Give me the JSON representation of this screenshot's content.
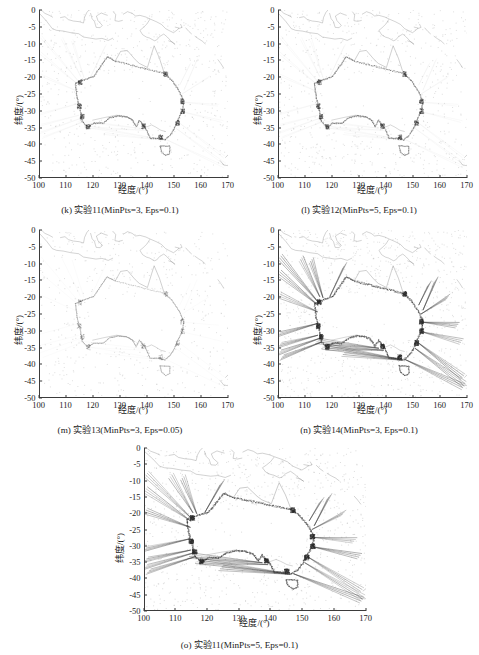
{
  "figure": {
    "kind": "multi-panel-scatter-map",
    "panel_count": 5,
    "layout": "2-2-1",
    "colors": {
      "coastline": "#6e6e6e",
      "cluster_dark": "#2b2b2b",
      "noise_light": "#b9b9b9",
      "axis": "#3b3b3b",
      "background": "#ffffff"
    }
  },
  "axes": {
    "xlabel": "经度/(°)",
    "ylabel": "纬度/(°)",
    "xticks": [
      "100",
      "110",
      "120",
      "130",
      "140",
      "150",
      "160",
      "170"
    ],
    "yticks": [
      "0",
      "-5",
      "-10",
      "-15",
      "-20",
      "-25",
      "-30",
      "-35",
      "-40",
      "-45",
      "-50"
    ],
    "xlim": [
      100,
      170
    ],
    "ylim": [
      -50,
      0
    ]
  },
  "panels": [
    {
      "id": "k",
      "caption": "(k) 实验11(MinPts=3, Eps=0.1)",
      "experiment": "实验11",
      "minpts": "3",
      "eps": "0.1",
      "density": "medium",
      "ray_strength": 0.25
    },
    {
      "id": "l",
      "caption": "(l) 实验12(MinPts=5, Eps=0.1)",
      "experiment": "实验12",
      "minpts": "5",
      "eps": "0.1",
      "density": "medium",
      "ray_strength": 0.3
    },
    {
      "id": "m",
      "caption": "(m) 实验13(MinPts=3, Eps=0.05)",
      "experiment": "实验13",
      "minpts": "3",
      "eps": "0.05",
      "density": "sparse",
      "ray_strength": 0.12
    },
    {
      "id": "n",
      "caption": "(n) 实验14(MinPts=3, Eps=0.1)",
      "experiment": "实验14",
      "minpts": "3",
      "eps": "0.1",
      "density": "dense",
      "ray_strength": 1.0
    },
    {
      "id": "o",
      "caption": "(o) 实验11(MinPts=5, Eps=0.1)",
      "experiment": "实验11",
      "minpts": "5",
      "eps": "0.1",
      "density": "dense",
      "ray_strength": 0.85
    }
  ],
  "chart_data": {
    "type": "scatter",
    "title": "",
    "xlabel": "经度/(°)",
    "ylabel": "纬度/(°)",
    "xlim": [
      100,
      170
    ],
    "ylim": [
      -50,
      0
    ],
    "xticks": [
      100,
      110,
      120,
      130,
      140,
      150,
      160,
      170
    ],
    "yticks": [
      0,
      -5,
      -10,
      -15,
      -20,
      -25,
      -30,
      -35,
      -40,
      -45,
      -50
    ],
    "grid": false,
    "legend": null,
    "subplots": [
      {
        "id": "k",
        "label": "(k) 实验11(MinPts=3, Eps=0.1)",
        "params": {
          "MinPts": 3,
          "Eps": 0.1
        }
      },
      {
        "id": "l",
        "label": "(l) 实验12(MinPts=5, Eps=0.1)",
        "params": {
          "MinPts": 5,
          "Eps": 0.1
        }
      },
      {
        "id": "m",
        "label": "(m) 实验13(MinPts=3, Eps=0.05)",
        "params": {
          "MinPts": 3,
          "Eps": 0.05
        }
      },
      {
        "id": "n",
        "label": "(n) 实验14(MinPts=3, Eps=0.1)",
        "params": {
          "MinPts": 3,
          "Eps": 0.1
        }
      },
      {
        "id": "o",
        "label": "(o) 实验11(MinPts=5, Eps=0.1)",
        "params": {
          "MinPts": 5,
          "Eps": 0.1
        }
      }
    ],
    "coastline_outline": {
      "name": "Australia and surrounding region coastline",
      "australia_mainland": [
        [
          113.2,
          -22.0
        ],
        [
          113.8,
          -26.1
        ],
        [
          115.0,
          -30.0
        ],
        [
          115.7,
          -33.3
        ],
        [
          117.8,
          -35.1
        ],
        [
          120.0,
          -33.9
        ],
        [
          123.5,
          -33.9
        ],
        [
          126.0,
          -32.3
        ],
        [
          129.0,
          -31.7
        ],
        [
          132.2,
          -32.0
        ],
        [
          134.2,
          -32.8
        ],
        [
          135.8,
          -34.9
        ],
        [
          137.0,
          -33.0
        ],
        [
          138.1,
          -34.2
        ],
        [
          139.5,
          -35.6
        ],
        [
          141.0,
          -38.4
        ],
        [
          144.5,
          -38.4
        ],
        [
          146.4,
          -38.9
        ],
        [
          148.5,
          -37.5
        ],
        [
          150.0,
          -35.5
        ],
        [
          151.3,
          -33.0
        ],
        [
          153.0,
          -30.3
        ],
        [
          153.5,
          -27.4
        ],
        [
          152.0,
          -24.5
        ],
        [
          149.2,
          -21.1
        ],
        [
          146.3,
          -19.0
        ],
        [
          144.5,
          -14.5
        ],
        [
          142.5,
          -10.7
        ],
        [
          141.6,
          -13.0
        ],
        [
          140.0,
          -17.2
        ],
        [
          137.0,
          -16.0
        ],
        [
          135.5,
          -14.9
        ],
        [
          132.5,
          -12.1
        ],
        [
          130.0,
          -12.4
        ],
        [
          128.0,
          -15.3
        ],
        [
          125.0,
          -14.0
        ],
        [
          122.2,
          -17.3
        ],
        [
          120.0,
          -19.9
        ],
        [
          117.0,
          -20.7
        ],
        [
          113.2,
          -22.0
        ]
      ],
      "tasmania": [
        [
          144.7,
          -40.7
        ],
        [
          148.3,
          -40.8
        ],
        [
          148.3,
          -43.0
        ],
        [
          146.8,
          -43.6
        ],
        [
          145.2,
          -42.5
        ],
        [
          144.7,
          -40.7
        ]
      ],
      "indonesia_png_note": "Indonesian archipelago, Java, Timor, New Guinea and island chains rendered across latitudes 0 to -11"
    }
  }
}
